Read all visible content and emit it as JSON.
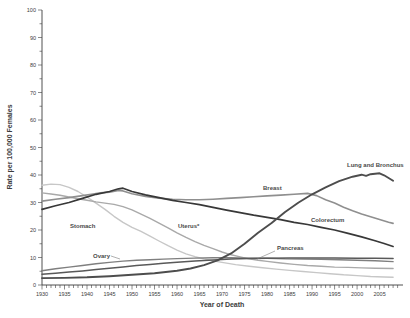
{
  "figure": {
    "background": "#ffffff",
    "axis_color": "#3c3c3c",
    "tick_label_color": "#3c3c3c",
    "series_label_color": "#4a4a4a"
  },
  "chart_data": {
    "type": "line",
    "title": "",
    "xlabel": "Year of Death",
    "ylabel": "Rate per 100,000 Females",
    "legend": "inline-labels",
    "grid": false,
    "x_range": {
      "data": [
        1930,
        2010.2
      ],
      "px": [
        42,
        403
      ]
    },
    "y_range": {
      "data": [
        0,
        100
      ],
      "px": [
        285,
        10
      ]
    },
    "ticks": {
      "x": {
        "minor_step": 1,
        "minor_start": 1930,
        "minor_end": 2009,
        "major_step": 5,
        "major_start": 1930,
        "major_end": 2005,
        "labels": [
          "1930",
          "1935",
          "1940",
          "1945",
          "1950",
          "1955",
          "1960",
          "1965",
          "1970",
          "1975",
          "1980",
          "1985",
          "1990",
          "1995",
          "2000",
          "2005"
        ]
      },
      "y": {
        "minor_step": 5,
        "major_step": 10,
        "labels": [
          "0",
          "10",
          "20",
          "30",
          "40",
          "50",
          "60",
          "70",
          "80",
          "90",
          "100"
        ]
      }
    },
    "series": [
      {
        "name": "Stomach",
        "color": "#c7c7c7",
        "width": 1.4,
        "points": [
          [
            1930,
            36.3
          ],
          [
            1932,
            36.7
          ],
          [
            1934,
            36.5
          ],
          [
            1936,
            35.5
          ],
          [
            1938,
            34.0
          ],
          [
            1940,
            32.0
          ],
          [
            1942,
            29.8
          ],
          [
            1944,
            27.5
          ],
          [
            1946,
            25.0
          ],
          [
            1948,
            22.8
          ],
          [
            1950,
            21.0
          ],
          [
            1952,
            19.5
          ],
          [
            1954,
            17.8
          ],
          [
            1956,
            16.0
          ],
          [
            1958,
            14.3
          ],
          [
            1960,
            12.7
          ],
          [
            1962,
            11.3
          ],
          [
            1964,
            10.3
          ],
          [
            1966,
            9.5
          ],
          [
            1968,
            8.8
          ],
          [
            1970,
            8.2
          ],
          [
            1973,
            7.4
          ],
          [
            1976,
            6.8
          ],
          [
            1979,
            6.3
          ],
          [
            1982,
            5.8
          ],
          [
            1985,
            5.3
          ],
          [
            1988,
            4.9
          ],
          [
            1991,
            4.5
          ],
          [
            1994,
            4.1
          ],
          [
            1997,
            3.7
          ],
          [
            2000,
            3.4
          ],
          [
            2003,
            3.1
          ],
          [
            2006,
            2.9
          ],
          [
            2008,
            2.8
          ]
        ]
      },
      {
        "name": "Uterus*",
        "color": "#a9a9a9",
        "width": 1.4,
        "points": [
          [
            1930,
            33.5
          ],
          [
            1932,
            33.1
          ],
          [
            1934,
            32.6
          ],
          [
            1936,
            32.0
          ],
          [
            1938,
            31.4
          ],
          [
            1940,
            30.8
          ],
          [
            1942,
            30.2
          ],
          [
            1944,
            29.8
          ],
          [
            1946,
            29.3
          ],
          [
            1948,
            28.5
          ],
          [
            1950,
            27.3
          ],
          [
            1952,
            25.8
          ],
          [
            1954,
            24.2
          ],
          [
            1956,
            22.5
          ],
          [
            1958,
            20.8
          ],
          [
            1960,
            19.0
          ],
          [
            1962,
            17.3
          ],
          [
            1964,
            15.8
          ],
          [
            1966,
            14.4
          ],
          [
            1968,
            13.2
          ],
          [
            1970,
            12.0
          ],
          [
            1972,
            11.0
          ],
          [
            1974,
            10.2
          ],
          [
            1976,
            9.5
          ],
          [
            1978,
            9.0
          ],
          [
            1980,
            8.6
          ],
          [
            1983,
            8.0
          ],
          [
            1986,
            7.5
          ],
          [
            1989,
            7.1
          ],
          [
            1992,
            6.8
          ],
          [
            1995,
            6.5
          ],
          [
            1998,
            6.4
          ],
          [
            2001,
            6.2
          ],
          [
            2004,
            6.1
          ],
          [
            2008,
            6.0
          ]
        ]
      },
      {
        "name": "Ovary",
        "color": "#7f7f7f",
        "width": 1.4,
        "points": [
          [
            1930,
            5.2
          ],
          [
            1933,
            5.9
          ],
          [
            1936,
            6.5
          ],
          [
            1939,
            7.1
          ],
          [
            1942,
            7.7
          ],
          [
            1945,
            8.2
          ],
          [
            1948,
            8.7
          ],
          [
            1951,
            9.0
          ],
          [
            1954,
            9.2
          ],
          [
            1957,
            9.4
          ],
          [
            1960,
            9.6
          ],
          [
            1964,
            9.8
          ],
          [
            1968,
            9.9
          ],
          [
            1972,
            9.9
          ],
          [
            1976,
            9.8
          ],
          [
            1980,
            9.7
          ],
          [
            1984,
            9.5
          ],
          [
            1988,
            9.4
          ],
          [
            1992,
            9.3
          ],
          [
            1996,
            9.2
          ],
          [
            2000,
            9.0
          ],
          [
            2004,
            8.8
          ],
          [
            2008,
            8.5
          ]
        ]
      },
      {
        "name": "Breast",
        "color": "#8f8f8f",
        "width": 1.6,
        "points": [
          [
            1930,
            30.5
          ],
          [
            1933,
            31.2
          ],
          [
            1936,
            31.8
          ],
          [
            1939,
            32.5
          ],
          [
            1941,
            33.0
          ],
          [
            1943,
            33.5
          ],
          [
            1945,
            33.8
          ],
          [
            1947,
            34.4
          ],
          [
            1948,
            34.2
          ],
          [
            1950,
            33.2
          ],
          [
            1953,
            32.2
          ],
          [
            1956,
            31.6
          ],
          [
            1959,
            31.2
          ],
          [
            1962,
            31.0
          ],
          [
            1965,
            31.0
          ],
          [
            1968,
            31.2
          ],
          [
            1971,
            31.5
          ],
          [
            1974,
            31.8
          ],
          [
            1977,
            32.1
          ],
          [
            1980,
            32.4
          ],
          [
            1983,
            32.7
          ],
          [
            1986,
            33.0
          ],
          [
            1989,
            33.3
          ],
          [
            1991,
            32.5
          ],
          [
            1993,
            31.0
          ],
          [
            1995,
            29.8
          ],
          [
            1997,
            28.3
          ],
          [
            1999,
            27.0
          ],
          [
            2001,
            25.8
          ],
          [
            2003,
            24.8
          ],
          [
            2005,
            23.8
          ],
          [
            2007,
            22.8
          ],
          [
            2008,
            22.4
          ]
        ]
      },
      {
        "name": "Pancreas",
        "color": "#595959",
        "width": 1.5,
        "points": [
          [
            1930,
            3.9
          ],
          [
            1933,
            4.3
          ],
          [
            1936,
            4.7
          ],
          [
            1939,
            5.1
          ],
          [
            1942,
            5.6
          ],
          [
            1945,
            6.1
          ],
          [
            1948,
            6.6
          ],
          [
            1951,
            7.1
          ],
          [
            1954,
            7.5
          ],
          [
            1957,
            7.9
          ],
          [
            1960,
            8.3
          ],
          [
            1964,
            8.7
          ],
          [
            1968,
            9.1
          ],
          [
            1972,
            9.4
          ],
          [
            1976,
            9.6
          ],
          [
            1980,
            9.7
          ],
          [
            1985,
            9.8
          ],
          [
            1990,
            9.8
          ],
          [
            1995,
            9.8
          ],
          [
            2000,
            9.7
          ],
          [
            2004,
            9.7
          ],
          [
            2008,
            9.6
          ]
        ]
      },
      {
        "name": "Colorectum",
        "color": "#383838",
        "width": 1.7,
        "points": [
          [
            1930,
            27.5
          ],
          [
            1933,
            28.8
          ],
          [
            1936,
            30.0
          ],
          [
            1939,
            31.5
          ],
          [
            1942,
            33.0
          ],
          [
            1945,
            34.0
          ],
          [
            1947,
            35.0
          ],
          [
            1948,
            35.2
          ],
          [
            1950,
            34.0
          ],
          [
            1953,
            32.8
          ],
          [
            1956,
            31.8
          ],
          [
            1959,
            30.8
          ],
          [
            1962,
            30.0
          ],
          [
            1965,
            29.2
          ],
          [
            1968,
            28.2
          ],
          [
            1971,
            27.2
          ],
          [
            1974,
            26.3
          ],
          [
            1977,
            25.4
          ],
          [
            1980,
            24.6
          ],
          [
            1983,
            23.8
          ],
          [
            1986,
            22.8
          ],
          [
            1989,
            22.0
          ],
          [
            1992,
            21.0
          ],
          [
            1995,
            20.0
          ],
          [
            1998,
            18.8
          ],
          [
            2001,
            17.5
          ],
          [
            2004,
            16.1
          ],
          [
            2006,
            15.1
          ],
          [
            2008,
            14.0
          ]
        ]
      },
      {
        "name": "Lung and Bronchus",
        "color": "#4d4d4d",
        "width": 1.9,
        "points": [
          [
            1930,
            2.5
          ],
          [
            1935,
            2.6
          ],
          [
            1940,
            2.8
          ],
          [
            1945,
            3.2
          ],
          [
            1950,
            3.7
          ],
          [
            1955,
            4.3
          ],
          [
            1960,
            5.2
          ],
          [
            1963,
            6.0
          ],
          [
            1966,
            7.2
          ],
          [
            1969,
            9.0
          ],
          [
            1972,
            11.5
          ],
          [
            1975,
            15.0
          ],
          [
            1978,
            19.0
          ],
          [
            1981,
            22.5
          ],
          [
            1984,
            26.5
          ],
          [
            1987,
            30.0
          ],
          [
            1990,
            33.0
          ],
          [
            1993,
            35.5
          ],
          [
            1996,
            37.8
          ],
          [
            1999,
            39.4
          ],
          [
            2001,
            40.1
          ],
          [
            2002,
            39.7
          ],
          [
            2003,
            40.3
          ],
          [
            2005,
            40.6
          ],
          [
            2006,
            39.9
          ],
          [
            2007,
            38.9
          ],
          [
            2008,
            37.9
          ]
        ]
      }
    ],
    "annotations": [
      {
        "text": "Stomach",
        "x": 70,
        "y": 228,
        "anchor": "start"
      },
      {
        "text": "Ovary",
        "x": 93,
        "y": 258,
        "anchor": "start",
        "leader": {
          "x1": 111,
          "y1": 256,
          "x2": 120,
          "y2": 259
        }
      },
      {
        "text": "Uterus*",
        "x": 178,
        "y": 228,
        "anchor": "start"
      },
      {
        "text": "Breast",
        "x": 263,
        "y": 190,
        "anchor": "start"
      },
      {
        "text": "Pancreas",
        "x": 277,
        "y": 250,
        "anchor": "start",
        "leader": {
          "x1": 275,
          "y1": 251,
          "x2": 257,
          "y2": 259
        }
      },
      {
        "text": "Colorectum",
        "x": 311,
        "y": 222,
        "anchor": "start"
      },
      {
        "text": "Lung and Bronchus",
        "x": 347,
        "y": 167,
        "anchor": "start"
      }
    ]
  }
}
